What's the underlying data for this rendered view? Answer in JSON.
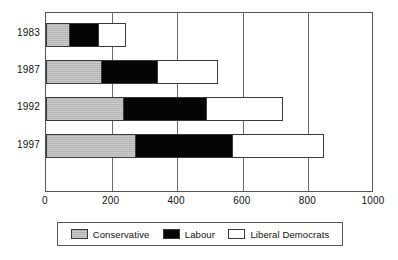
{
  "chart_data": {
    "type": "bar",
    "orientation": "horizontal",
    "stacked": true,
    "title": "",
    "subtitle": "",
    "xlabel": "",
    "ylabel": "",
    "categories": [
      "1983",
      "1987",
      "1992",
      "1997"
    ],
    "series": [
      {
        "name": "Conservative",
        "color": "#b9b9b9",
        "values": [
          72,
          170,
          237,
          274
        ]
      },
      {
        "name": "Labour",
        "color": "#050505",
        "values": [
          89,
          171,
          253,
          295
        ]
      },
      {
        "name": "Liberal Democrats",
        "color": "#ffffff",
        "values": [
          84,
          182,
          233,
          278
        ]
      }
    ],
    "totals": [
      245,
      523,
      723,
      847
    ],
    "xlim": [
      0,
      1000
    ],
    "xticks": [
      0,
      200,
      400,
      600,
      800,
      1000
    ],
    "xtick_labels": [
      "0",
      "200",
      "400",
      "600",
      "800",
      "1000"
    ],
    "grid": true,
    "grid_axis": "x",
    "legend_position": "bottom"
  },
  "axis": {
    "y_labels": [
      "1983",
      "1987",
      "1992",
      "1997"
    ],
    "x_labels": [
      "0",
      "200",
      "400",
      "600",
      "800",
      "1000"
    ]
  },
  "legend": {
    "items": [
      {
        "label": "Conservative",
        "swatch": "conservative-swatch"
      },
      {
        "label": "Labour",
        "swatch": "labour-swatch"
      },
      {
        "label": "Liberal Democrats",
        "swatch": "liberal-democrats-swatch"
      }
    ]
  },
  "colors": {
    "conservative": "#b9b9b9",
    "labour": "#050505",
    "liberal_democrats": "#ffffff",
    "axis": "#555555",
    "grid": "#6a6a6a",
    "text": "#111111"
  }
}
